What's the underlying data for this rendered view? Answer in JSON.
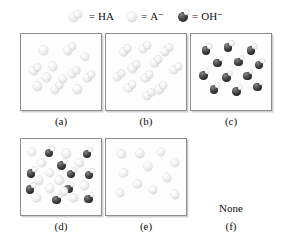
{
  "legend": {
    "items": [
      {
        "glyph": "ha-dimer",
        "equals": "=",
        "label": "HA"
      },
      {
        "glyph": "a-minus-sphere",
        "equals": "=",
        "label": "A⁻"
      },
      {
        "glyph": "oh-minus-sphere",
        "equals": "=",
        "label": "OH⁻"
      }
    ]
  },
  "colors": {
    "light_sphere": "#ededed",
    "dark_sphere": "#242424",
    "box_border": "#8d8d8d",
    "background": "#ffffff",
    "text": "#111111"
  },
  "panels": [
    {
      "id": "a",
      "label": "(a)",
      "contents": "mixture of HA dimers and A⁻ spheres",
      "counts": {
        "HA": 5,
        "A-": 7,
        "OH-": 0
      },
      "particles": [
        {
          "species": "A-",
          "x": 22,
          "y": 16
        },
        {
          "species": "HA",
          "x": 52,
          "y": 12
        },
        {
          "species": "A-",
          "x": 73,
          "y": 24
        },
        {
          "species": "HA",
          "x": 10,
          "y": 38
        },
        {
          "species": "A-",
          "x": 34,
          "y": 36
        },
        {
          "species": "HA",
          "x": 57,
          "y": 42
        },
        {
          "species": "HA",
          "x": 76,
          "y": 47
        },
        {
          "species": "A-",
          "x": 15,
          "y": 62
        },
        {
          "species": "HA",
          "x": 36,
          "y": 62
        },
        {
          "species": "A-",
          "x": 64,
          "y": 66
        },
        {
          "species": "A-",
          "x": 46,
          "y": 52
        },
        {
          "species": "A-",
          "x": 26,
          "y": 50
        }
      ]
    },
    {
      "id": "b",
      "label": "(b)",
      "contents": "all HA dimers, no free ions",
      "counts": {
        "HA": 11,
        "A-": 0,
        "OH-": 0
      },
      "particles": [
        {
          "species": "HA",
          "x": 16,
          "y": 14
        },
        {
          "species": "HA",
          "x": 40,
          "y": 10
        },
        {
          "species": "HA",
          "x": 67,
          "y": 13
        },
        {
          "species": "HA",
          "x": 54,
          "y": 28
        },
        {
          "species": "HA",
          "x": 27,
          "y": 35
        },
        {
          "species": "HA",
          "x": 78,
          "y": 37
        },
        {
          "species": "HA",
          "x": 8,
          "y": 46
        },
        {
          "species": "HA",
          "x": 43,
          "y": 47
        },
        {
          "species": "HA",
          "x": 22,
          "y": 60
        },
        {
          "species": "HA",
          "x": 60,
          "y": 62
        },
        {
          "species": "HA",
          "x": 45,
          "y": 70
        }
      ]
    },
    {
      "id": "c",
      "label": "(c)",
      "contents": "all OH⁻ ions",
      "counts": {
        "HA": 0,
        "A-": 0,
        "OH-": 12
      },
      "particles": [
        {
          "species": "OH-",
          "x": 13,
          "y": 13
        },
        {
          "species": "OH-",
          "x": 40,
          "y": 9
        },
        {
          "species": "OH-",
          "x": 68,
          "y": 13
        },
        {
          "species": "OH-",
          "x": 27,
          "y": 29
        },
        {
          "species": "OH-",
          "x": 53,
          "y": 28
        },
        {
          "species": "OH-",
          "x": 78,
          "y": 32
        },
        {
          "species": "OH-",
          "x": 10,
          "y": 45
        },
        {
          "species": "OH-",
          "x": 38,
          "y": 48
        },
        {
          "species": "OH-",
          "x": 64,
          "y": 46
        },
        {
          "species": "OH-",
          "x": 23,
          "y": 63
        },
        {
          "species": "OH-",
          "x": 50,
          "y": 66
        },
        {
          "species": "OH-",
          "x": 76,
          "y": 60
        }
      ]
    },
    {
      "id": "d",
      "label": "(d)",
      "contents": "mixture of OH⁻ ions and A⁻ spheres",
      "counts": {
        "HA": 0,
        "A-": 12,
        "OH-": 10
      },
      "particles": [
        {
          "species": "A-",
          "x": 8,
          "y": 11
        },
        {
          "species": "OH-",
          "x": 29,
          "y": 10
        },
        {
          "species": "A-",
          "x": 50,
          "y": 13
        },
        {
          "species": "OH-",
          "x": 75,
          "y": 11
        },
        {
          "species": "A-",
          "x": 20,
          "y": 25
        },
        {
          "species": "OH-",
          "x": 44,
          "y": 26
        },
        {
          "species": "A-",
          "x": 66,
          "y": 25
        },
        {
          "species": "OH-",
          "x": 7,
          "y": 36
        },
        {
          "species": "A-",
          "x": 30,
          "y": 38
        },
        {
          "species": "OH-",
          "x": 56,
          "y": 37
        },
        {
          "species": "OH-",
          "x": 78,
          "y": 38
        },
        {
          "species": "A-",
          "x": 17,
          "y": 48
        },
        {
          "species": "A-",
          "x": 42,
          "y": 48
        },
        {
          "species": "OH-",
          "x": 6,
          "y": 57
        },
        {
          "species": "A-",
          "x": 30,
          "y": 58
        },
        {
          "species": "OH-",
          "x": 53,
          "y": 56
        },
        {
          "species": "A-",
          "x": 72,
          "y": 54
        },
        {
          "species": "A-",
          "x": 14,
          "y": 70
        },
        {
          "species": "OH-",
          "x": 38,
          "y": 70
        },
        {
          "species": "A-",
          "x": 59,
          "y": 70
        },
        {
          "species": "OH-",
          "x": 77,
          "y": 69
        },
        {
          "species": "A-",
          "x": 47,
          "y": 62
        }
      ]
    },
    {
      "id": "e",
      "label": "(e)",
      "contents": "all A⁻ spheres",
      "counts": {
        "HA": 0,
        "A-": 11,
        "OH-": 0
      },
      "particles": [
        {
          "species": "A-",
          "x": 14,
          "y": 14
        },
        {
          "species": "A-",
          "x": 36,
          "y": 13
        },
        {
          "species": "A-",
          "x": 62,
          "y": 11
        },
        {
          "species": "A-",
          "x": 79,
          "y": 25
        },
        {
          "species": "A-",
          "x": 46,
          "y": 30
        },
        {
          "species": "A-",
          "x": 16,
          "y": 38
        },
        {
          "species": "A-",
          "x": 69,
          "y": 44
        },
        {
          "species": "A-",
          "x": 33,
          "y": 52
        },
        {
          "species": "A-",
          "x": 52,
          "y": 60
        },
        {
          "species": "A-",
          "x": 12,
          "y": 64
        },
        {
          "species": "A-",
          "x": 79,
          "y": 66
        }
      ]
    },
    {
      "id": "f",
      "label": "(f)",
      "contents": "none",
      "none_text": "None",
      "counts": {
        "HA": 0,
        "A-": 0,
        "OH-": 0
      },
      "particles": []
    }
  ]
}
